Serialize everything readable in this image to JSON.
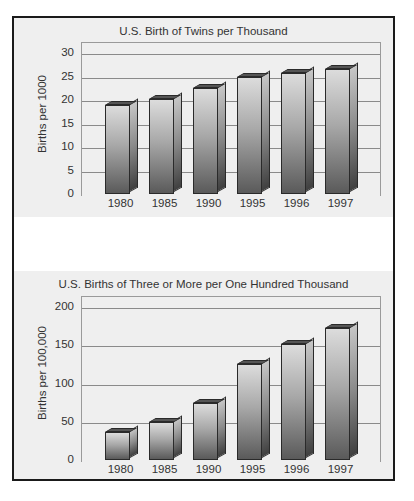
{
  "chart_data": [
    {
      "type": "bar",
      "title": "U.S. Birth of Twins per Thousand",
      "xlabel": "",
      "ylabel": "Births per 1000",
      "categories": [
        "1980",
        "1985",
        "1990",
        "1995",
        "1996",
        "1997"
      ],
      "values": [
        18.9,
        20.2,
        22.6,
        24.8,
        25.7,
        26.7
      ],
      "ylim": [
        0,
        30
      ],
      "yticks": [
        "0",
        "5",
        "10",
        "15",
        "20",
        "25",
        "30"
      ],
      "grid": true,
      "style": "3d-bar, grayscale gradient"
    },
    {
      "type": "bar",
      "title": "U.S. Births of Three or More per One Hundred Thousand",
      "xlabel": "",
      "ylabel": "Births per 100,000",
      "categories": [
        "1980",
        "1985",
        "1990",
        "1995",
        "1996",
        "1997"
      ],
      "values": [
        37,
        50,
        74,
        126,
        152,
        173
      ],
      "ylim": [
        0,
        200
      ],
      "yticks": [
        "0",
        "50",
        "100",
        "150",
        "200"
      ],
      "grid": true,
      "style": "3d-bar, grayscale gradient"
    }
  ]
}
